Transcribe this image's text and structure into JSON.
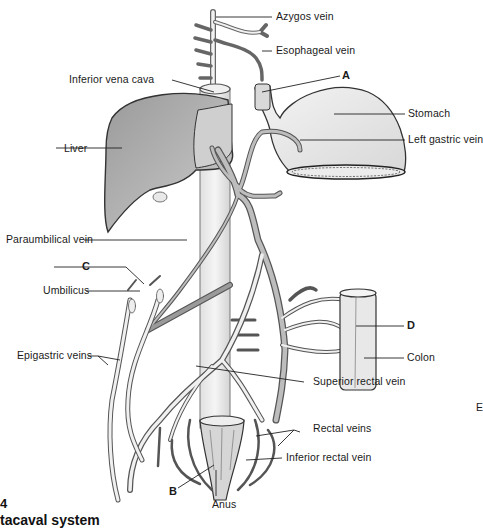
{
  "figure": {
    "number_fragment": "4",
    "title_fragment": "tacaval system",
    "edge_letter": "E"
  },
  "labels": {
    "azygos_vein": "Azygos vein",
    "esophageal_vein": "Esophageal vein",
    "a": "A",
    "inferior_vena_cava": "Inferior vena cava",
    "stomach": "Stomach",
    "left_gastric_vein": "Left gastric vein",
    "liver": "Liver",
    "paraumbilical_vein": "Paraumbilical vein",
    "c": "C",
    "umbilicus": "Umbilicus",
    "d": "D",
    "colon": "Colon",
    "epigastric_veins": "Epigastric veins",
    "superior_rectal_vein": "Superior rectal vein",
    "rectal_veins": "Rectal veins",
    "inferior_rectal_vein": "Inferior rectal vein",
    "b": "B",
    "anus": "Anus"
  },
  "colors": {
    "vein_fill": "#bdbdbd",
    "vein_stroke": "#555555",
    "organ_fill": "#e6e6e6",
    "liver_fill": "#a9a9a9",
    "leader_line": "#222222"
  }
}
